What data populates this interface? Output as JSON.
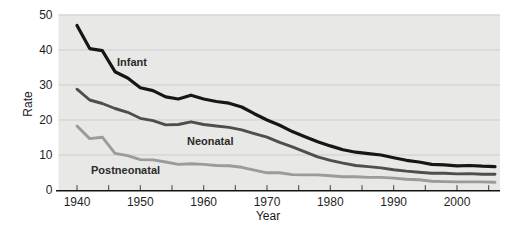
{
  "chart_data": {
    "type": "line",
    "title": "",
    "xlabel": "Year",
    "ylabel": "Rate",
    "xlim": [
      1940,
      2006
    ],
    "ylim": [
      0,
      50
    ],
    "grid": "horizontal",
    "legend_position": "inline-labels-on-lines",
    "plot_bg_color": "#e8e8e6",
    "grid_color": "#cdcdcb",
    "axis_color": "#141414",
    "tick_color": "#3f3f3f",
    "y_ticks": [
      0,
      10,
      20,
      30,
      40,
      50
    ],
    "x_ticks": [
      1940,
      1945,
      1950,
      1955,
      1960,
      1965,
      1970,
      1975,
      1980,
      1985,
      1990,
      1995,
      2000,
      2005
    ],
    "x_tick_labels": [
      "1940",
      "1950",
      "1960",
      "1970",
      "1980",
      "1990",
      "2000"
    ],
    "x_tick_label_years": [
      1940,
      1950,
      1960,
      1970,
      1980,
      1990,
      2000
    ],
    "x": [
      1940,
      1942,
      1944,
      1946,
      1948,
      1950,
      1952,
      1954,
      1956,
      1958,
      1960,
      1962,
      1964,
      1966,
      1968,
      1970,
      1972,
      1974,
      1976,
      1978,
      1980,
      1982,
      1984,
      1986,
      1988,
      1990,
      1992,
      1994,
      1996,
      1998,
      2000,
      2002,
      2004,
      2006
    ],
    "series": [
      {
        "name": "Infant",
        "color": "#161616",
        "line_width": 3.2,
        "label_color": "#161616",
        "values": [
          47.0,
          40.4,
          39.8,
          33.8,
          32.0,
          29.2,
          28.4,
          26.6,
          26.0,
          27.1,
          26.0,
          25.3,
          24.8,
          23.7,
          21.8,
          20.0,
          18.5,
          16.7,
          15.2,
          13.8,
          12.6,
          11.5,
          10.8,
          10.4,
          10.0,
          9.2,
          8.5,
          8.0,
          7.3,
          7.2,
          6.9,
          7.0,
          6.8,
          6.7
        ]
      },
      {
        "name": "Neonatal",
        "color": "#4e4e4c",
        "line_width": 2.9,
        "label_color": "#3c3c3c",
        "values": [
          28.8,
          25.7,
          24.7,
          23.3,
          22.2,
          20.5,
          19.8,
          18.6,
          18.7,
          19.5,
          18.7,
          18.3,
          17.9,
          17.2,
          16.1,
          15.1,
          13.6,
          12.3,
          10.9,
          9.5,
          8.5,
          7.7,
          7.0,
          6.7,
          6.3,
          5.8,
          5.4,
          5.1,
          4.8,
          4.8,
          4.6,
          4.7,
          4.5,
          4.5
        ]
      },
      {
        "name": "Postneonatal",
        "color": "#9b9b99",
        "line_width": 2.9,
        "label_color": "#2b2b2b",
        "values": [
          18.3,
          14.7,
          15.1,
          10.5,
          9.8,
          8.7,
          8.6,
          8.0,
          7.3,
          7.5,
          7.3,
          7.0,
          6.9,
          6.5,
          5.7,
          4.9,
          4.9,
          4.4,
          4.3,
          4.3,
          4.1,
          3.8,
          3.8,
          3.6,
          3.6,
          3.4,
          3.1,
          2.9,
          2.5,
          2.4,
          2.3,
          2.3,
          2.3,
          2.2
        ]
      }
    ]
  }
}
